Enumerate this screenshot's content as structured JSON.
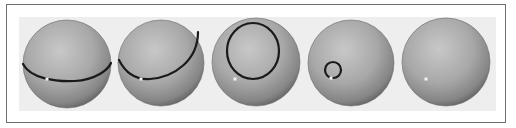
{
  "figure": {
    "colors": {
      "frame_border": "#6e6e6e",
      "panel_bg": "#eeeeee",
      "sphere_light": "#c4c4c4",
      "sphere_mid": "#9a9a9a",
      "sphere_dark": "#5a5a5a",
      "loop": "#1a1a1a",
      "base_point": "#f2f2f2"
    },
    "spheres": [
      {
        "id": "sphere-1",
        "cx": 67,
        "cy": 64,
        "r": 44,
        "loop": {
          "type": "equator",
          "d": "M23,64 C30,78 55,82 75,81 C95,80 108,70 111,63"
        },
        "point": {
          "x": 47,
          "y": 79
        }
      },
      {
        "id": "sphere-2",
        "cx": 161,
        "cy": 63,
        "r": 43,
        "loop": {
          "type": "tilted",
          "d": "M119,60 C125,72 135,80 150,79 C175,77 198,60 198,32"
        },
        "point": {
          "x": 141,
          "y": 79
        }
      },
      {
        "id": "sphere-3",
        "cx": 256,
        "cy": 62,
        "r": 44,
        "loop": {
          "type": "circle",
          "cx": 253,
          "cy": 51,
          "rx": 26,
          "ry": 28
        },
        "point": {
          "x": 235,
          "y": 79
        }
      },
      {
        "id": "sphere-4",
        "cx": 351,
        "cy": 63,
        "r": 43,
        "loop": {
          "type": "small-circle",
          "cx": 333,
          "cy": 70,
          "rx": 8,
          "ry": 8
        },
        "point": {
          "x": 331,
          "y": 78
        }
      },
      {
        "id": "sphere-5",
        "cx": 446,
        "cy": 62,
        "r": 44,
        "loop": {
          "type": "none"
        },
        "point": {
          "x": 426,
          "y": 79
        }
      }
    ]
  }
}
